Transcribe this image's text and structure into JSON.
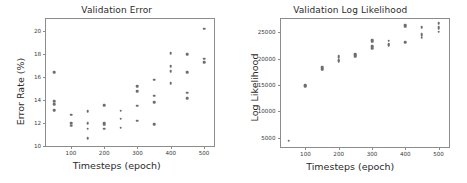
{
  "figure": {
    "background": "#ffffff",
    "marker_color": "#6e6e6e",
    "axis_color": "#8c8c8c"
  },
  "chart_data": [
    {
      "type": "scatter",
      "title": "Validation Error",
      "xlabel": "Timesteps (epoch)",
      "ylabel": "Error Rate (%)",
      "xlim": [
        25,
        530
      ],
      "ylim": [
        10.0,
        21.0
      ],
      "xticks": [
        100,
        200,
        300,
        400,
        500
      ],
      "yticks": [
        10,
        12,
        14,
        16,
        18,
        20
      ],
      "xtick_labels": [
        "100",
        "200",
        "300",
        "400",
        "500"
      ],
      "ytick_labels": [
        "10",
        "12",
        "14",
        "16",
        "18",
        "20"
      ],
      "grid": false,
      "legend": "none",
      "points": [
        {
          "x": 50,
          "y": 16.4
        },
        {
          "x": 50,
          "y": 13.9
        },
        {
          "x": 50,
          "y": 13.6
        },
        {
          "x": 50,
          "y": 13.1
        },
        {
          "x": 100,
          "y": 12.7
        },
        {
          "x": 100,
          "y": 12.0
        },
        {
          "x": 100,
          "y": 11.75
        },
        {
          "x": 150,
          "y": 13.0
        },
        {
          "x": 150,
          "y": 12.0
        },
        {
          "x": 150,
          "y": 11.5
        },
        {
          "x": 150,
          "y": 10.7
        },
        {
          "x": 200,
          "y": 13.55
        },
        {
          "x": 200,
          "y": 11.95
        },
        {
          "x": 200,
          "y": 11.85
        },
        {
          "x": 200,
          "y": 11.5
        },
        {
          "x": 250,
          "y": 13.05
        },
        {
          "x": 250,
          "y": 12.35
        },
        {
          "x": 250,
          "y": 11.6
        },
        {
          "x": 300,
          "y": 15.2
        },
        {
          "x": 300,
          "y": 14.75
        },
        {
          "x": 300,
          "y": 13.5
        },
        {
          "x": 300,
          "y": 12.2
        },
        {
          "x": 350,
          "y": 15.75
        },
        {
          "x": 350,
          "y": 14.35
        },
        {
          "x": 350,
          "y": 13.8
        },
        {
          "x": 350,
          "y": 11.9
        },
        {
          "x": 400,
          "y": 18.05
        },
        {
          "x": 400,
          "y": 16.9
        },
        {
          "x": 400,
          "y": 16.5
        },
        {
          "x": 400,
          "y": 15.45
        },
        {
          "x": 450,
          "y": 17.95
        },
        {
          "x": 450,
          "y": 16.4
        },
        {
          "x": 450,
          "y": 14.6
        },
        {
          "x": 450,
          "y": 14.15
        },
        {
          "x": 500,
          "y": 20.15
        },
        {
          "x": 500,
          "y": 17.55
        },
        {
          "x": 500,
          "y": 17.25
        }
      ]
    },
    {
      "type": "scatter",
      "title": "Validation Log Likelihood",
      "xlabel": "Timesteps (epoch)",
      "ylabel": "Log Likelihood",
      "xlim": [
        25,
        530
      ],
      "ylim": [
        3200,
        27500
      ],
      "xticks": [
        100,
        200,
        300,
        400,
        500
      ],
      "yticks": [
        5000,
        10000,
        15000,
        20000,
        25000
      ],
      "xtick_labels": [
        "5000",
        "10000",
        "15000",
        "20000",
        "25000"
      ],
      "ytick_labels": [
        "5000",
        "10000",
        "15000",
        "20000",
        "25000"
      ],
      "grid": false,
      "legend": "none",
      "points": [
        {
          "x": 50,
          "y": 4400
        },
        {
          "x": 100,
          "y": 14950
        },
        {
          "x": 100,
          "y": 14750
        },
        {
          "x": 150,
          "y": 18300
        },
        {
          "x": 150,
          "y": 18100
        },
        {
          "x": 150,
          "y": 17900
        },
        {
          "x": 200,
          "y": 20500
        },
        {
          "x": 200,
          "y": 20200
        },
        {
          "x": 200,
          "y": 19650
        },
        {
          "x": 200,
          "y": 19450
        },
        {
          "x": 250,
          "y": 20800
        },
        {
          "x": 250,
          "y": 20600
        },
        {
          "x": 250,
          "y": 20350
        },
        {
          "x": 300,
          "y": 23500
        },
        {
          "x": 300,
          "y": 23200
        },
        {
          "x": 300,
          "y": 22300
        },
        {
          "x": 300,
          "y": 21950
        },
        {
          "x": 350,
          "y": 23350
        },
        {
          "x": 350,
          "y": 22700
        },
        {
          "x": 350,
          "y": 22500
        },
        {
          "x": 400,
          "y": 26350
        },
        {
          "x": 400,
          "y": 26050
        },
        {
          "x": 400,
          "y": 23100
        },
        {
          "x": 450,
          "y": 25950
        },
        {
          "x": 450,
          "y": 24600
        },
        {
          "x": 450,
          "y": 24300
        },
        {
          "x": 450,
          "y": 23950
        },
        {
          "x": 500,
          "y": 26700
        },
        {
          "x": 500,
          "y": 26000
        },
        {
          "x": 500,
          "y": 25700
        },
        {
          "x": 500,
          "y": 25050
        }
      ]
    }
  ]
}
